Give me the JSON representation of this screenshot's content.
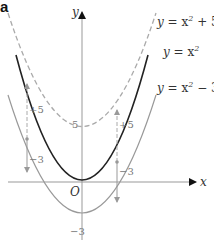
{
  "figure": {
    "tag": "a",
    "axes": {
      "x_label": "x",
      "y_label": "y",
      "origin_label": "O"
    },
    "y_ticks": {
      "five": "5",
      "minus_three": "−3"
    },
    "curves": [
      {
        "name": "y = x² + 5",
        "style": "dashed",
        "color": "#aaaaaa"
      },
      {
        "name": "y = x²",
        "style": "solid",
        "color": "#222222"
      },
      {
        "name": "y = x² − 3",
        "style": "solid",
        "color": "#999999"
      }
    ],
    "shift_labels": {
      "up": "+5",
      "down": "−3"
    }
  },
  "labels": {
    "c1_y": "y",
    "c1_eq": " = x",
    "c1_sup": "2",
    "c1_rest": " + 5",
    "c2_y": "y",
    "c2_eq": " = x",
    "c2_sup": "2",
    "c3_y": "y",
    "c3_eq": " = x",
    "c3_sup": "2",
    "c3_rest": " − 3"
  }
}
